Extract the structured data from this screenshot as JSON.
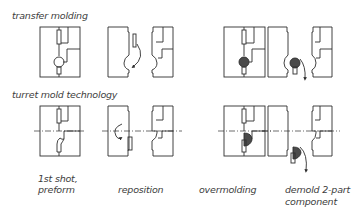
{
  "rows": [
    {
      "title": "transfer molding"
    },
    {
      "title": "turret mold technology"
    }
  ],
  "steps": [
    {
      "line1": "1st shot,",
      "line2": "preform"
    },
    {
      "line1": "reposition",
      "line2": ""
    },
    {
      "line1": "overmolding",
      "line2": ""
    },
    {
      "line1": "demold 2-part",
      "line2": "component"
    }
  ],
  "colors": {
    "line": "#2e2e2e",
    "fill": "#4a4a4a",
    "background": "#ffffff"
  }
}
